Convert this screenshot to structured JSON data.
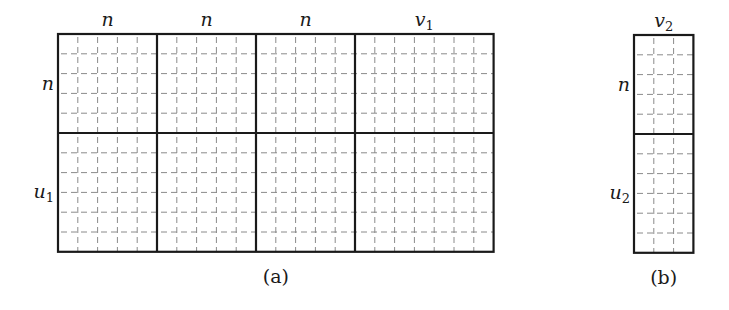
{
  "figure": {
    "panel_a": {
      "caption": "(a)",
      "x": 58,
      "y": 34,
      "cell": 19.8,
      "col_blocks": [
        {
          "label": "n",
          "sub": "",
          "cols": 5
        },
        {
          "label": "n",
          "sub": "",
          "cols": 5
        },
        {
          "label": "n",
          "sub": "",
          "cols": 5
        },
        {
          "label": "v",
          "sub": "1",
          "cols": 7
        }
      ],
      "row_blocks": [
        {
          "label": "n",
          "sub": "",
          "rows": 5
        },
        {
          "label": "u",
          "sub": "1",
          "rows": 6
        }
      ]
    },
    "panel_b": {
      "caption": "(b)",
      "x": 634,
      "y": 35,
      "cell": 19.8,
      "col_blocks": [
        {
          "label": "v",
          "sub": "2",
          "cols": 3
        }
      ],
      "row_blocks": [
        {
          "label": "n",
          "sub": "",
          "rows": 5
        },
        {
          "label": "u",
          "sub": "2",
          "rows": 6
        }
      ]
    },
    "colors": {
      "major": "#1a1a1a",
      "minor": "#8a8a8a"
    }
  }
}
